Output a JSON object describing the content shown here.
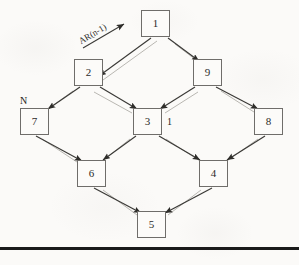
{
  "figure": {
    "type": "directed-graph-diagram",
    "background_color": "#fbfaf8",
    "ink_color": "#2b2a28",
    "edge_dark_color": "#3a3936",
    "edge_light_color": "#b9b7b2",
    "box_border_color": "#6f6d6a",
    "rule_color": "#1a1a1a"
  },
  "nodes": [
    {
      "id": "n1",
      "label": "1",
      "x": 141,
      "y": 10,
      "w": 29,
      "h": 27
    },
    {
      "id": "n2",
      "label": "2",
      "x": 74,
      "y": 59,
      "w": 29,
      "h": 27
    },
    {
      "id": "n9",
      "label": "9",
      "x": 193,
      "y": 59,
      "w": 29,
      "h": 27
    },
    {
      "id": "n7",
      "label": "7",
      "x": 20,
      "y": 108,
      "w": 29,
      "h": 27
    },
    {
      "id": "n3",
      "label": "3",
      "x": 133,
      "y": 108,
      "w": 29,
      "h": 27
    },
    {
      "id": "n8",
      "label": "8",
      "x": 254,
      "y": 108,
      "w": 29,
      "h": 27
    },
    {
      "id": "n6",
      "label": "6",
      "x": 77,
      "y": 160,
      "w": 29,
      "h": 27
    },
    {
      "id": "n4",
      "label": "4",
      "x": 199,
      "y": 160,
      "w": 29,
      "h": 27
    },
    {
      "id": "n5",
      "label": "5",
      "x": 137,
      "y": 211,
      "w": 29,
      "h": 27
    }
  ],
  "edges": [
    {
      "from": "n1",
      "to": "n2"
    },
    {
      "from": "n1",
      "to": "n9"
    },
    {
      "from": "n2",
      "to": "n7"
    },
    {
      "from": "n2",
      "to": "n3"
    },
    {
      "from": "n9",
      "to": "n3"
    },
    {
      "from": "n9",
      "to": "n8"
    },
    {
      "from": "n7",
      "to": "n6"
    },
    {
      "from": "n3",
      "to": "n6"
    },
    {
      "from": "n3",
      "to": "n4"
    },
    {
      "from": "n8",
      "to": "n4"
    },
    {
      "from": "n6",
      "to": "n5"
    },
    {
      "from": "n4",
      "to": "n5"
    }
  ],
  "labels": {
    "annotation": "AR(n-1)",
    "node_n_marker": "N",
    "node_three_marker": "1"
  }
}
